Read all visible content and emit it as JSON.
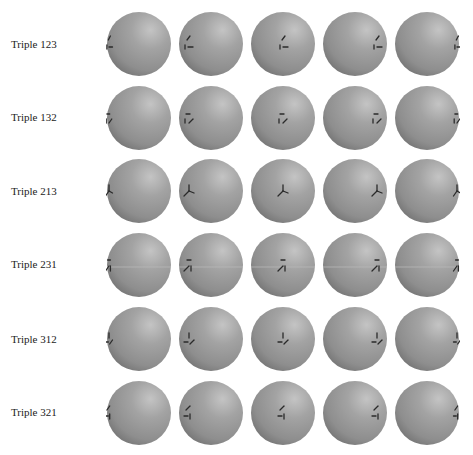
{
  "figure": {
    "background": "#ffffff",
    "sphere_color_base": "#8e8e8e",
    "sphere_color_highlight": "#c4c4c4",
    "sphere_color_shadow": "#6f6f6f",
    "glyph_color": "#2a2a2a",
    "columns": 5,
    "rows": [
      {
        "label": "Triple 123",
        "glyph": "123",
        "offsets": [
          -30,
          -23,
          0,
          22,
          30
        ]
      },
      {
        "label": "Triple 132",
        "glyph": "132",
        "offsets": [
          -30,
          -22,
          0,
          22,
          30
        ]
      },
      {
        "label": "Triple 213",
        "glyph": "213",
        "offsets": [
          -30,
          -22,
          0,
          22,
          30
        ]
      },
      {
        "label": "Triple 231",
        "glyph": "231",
        "offsets": [
          -30,
          -22,
          0,
          22,
          30
        ]
      },
      {
        "label": "Triple 312",
        "glyph": "312",
        "offsets": [
          -30,
          -22,
          0,
          22,
          30
        ]
      },
      {
        "label": "Triple 321",
        "glyph": "321",
        "offsets": [
          -30,
          -22,
          0,
          22,
          30
        ]
      }
    ]
  }
}
